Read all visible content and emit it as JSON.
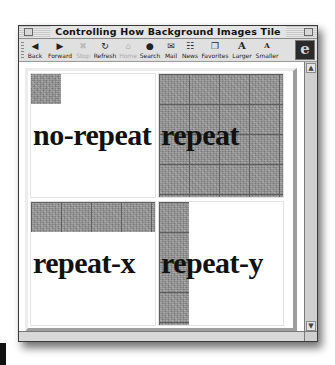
{
  "window": {
    "title": "Controlling How Background Images Tile"
  },
  "toolbar": {
    "buttons": [
      {
        "label": "Back",
        "icon": "back-arrow-icon",
        "glyph": "◀",
        "enabled": true
      },
      {
        "label": "Forward",
        "icon": "forward-arrow-icon",
        "glyph": "▶",
        "enabled": true
      },
      {
        "label": "Stop",
        "icon": "stop-icon",
        "glyph": "✖",
        "enabled": false
      },
      {
        "label": "Refresh",
        "icon": "refresh-icon",
        "glyph": "↻",
        "enabled": true
      },
      {
        "label": "Home",
        "icon": "home-icon",
        "glyph": "⌂",
        "enabled": false
      },
      {
        "label": "Search",
        "icon": "search-globe-icon",
        "glyph": "●",
        "enabled": true
      },
      {
        "label": "Mail",
        "icon": "mail-icon",
        "glyph": "✉",
        "enabled": true
      },
      {
        "label": "News",
        "icon": "news-icon",
        "glyph": "☷",
        "enabled": true
      },
      {
        "label": "Favorites",
        "icon": "favorites-icon",
        "glyph": "❐",
        "enabled": true
      },
      {
        "label": "Larger",
        "icon": "larger-text-icon",
        "glyph": "A",
        "enabled": true
      },
      {
        "label": "Smaller",
        "icon": "smaller-text-icon",
        "glyph": "A",
        "enabled": true
      }
    ],
    "browser_logo": "e"
  },
  "content": {
    "cells": [
      {
        "id": "no-repeat",
        "label": "no-repeat",
        "background_repeat": "no-repeat"
      },
      {
        "id": "repeat",
        "label": "repeat",
        "background_repeat": "repeat"
      },
      {
        "id": "repeat-x",
        "label": "repeat-x",
        "background_repeat": "repeat-x"
      },
      {
        "id": "repeat-y",
        "label": "repeat-y",
        "background_repeat": "repeat-y"
      }
    ]
  },
  "scrollbar": {
    "up_arrow": "▲",
    "down_arrow": "▼"
  }
}
